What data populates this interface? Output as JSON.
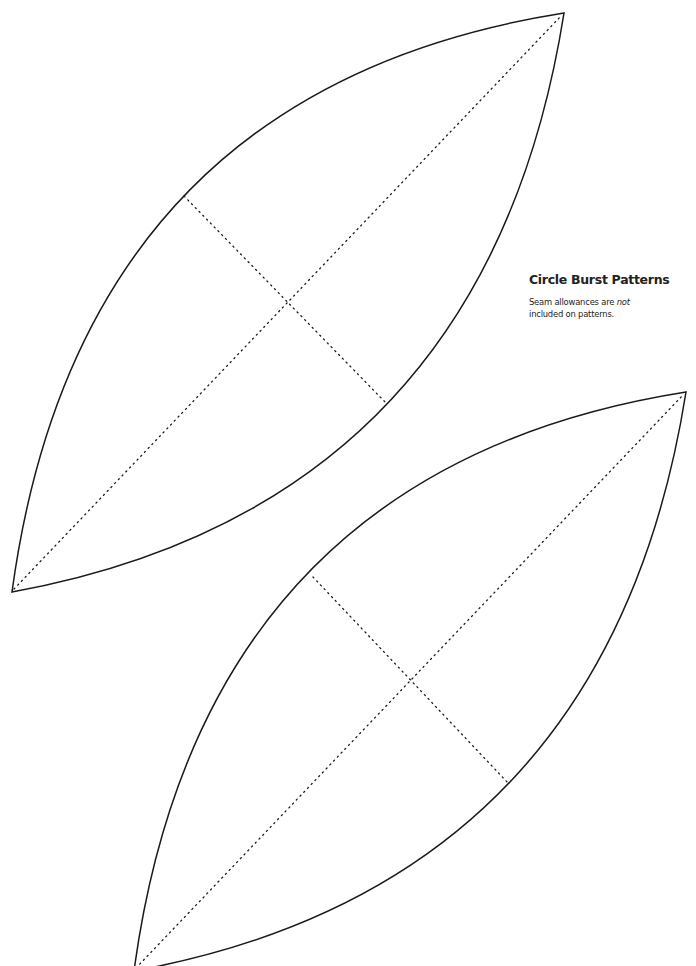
{
  "document": {
    "title": "Circle Burst Patterns",
    "note": {
      "line1_prefix": "Seam allowances are ",
      "line1_emphasis": "not",
      "line2": "included on patterns."
    }
  },
  "colors": {
    "background": "#ffffff",
    "outline": "#1a1a1a",
    "text": "#222222"
  },
  "pattern_pieces": [
    {
      "name": "leaf-piece-1",
      "tip_bottom_left": [
        12,
        592
      ],
      "tip_top_right": [
        564,
        13
      ],
      "cross_line": [
        [
          184,
          196
        ],
        [
          387,
          404
        ]
      ]
    },
    {
      "name": "leaf-piece-2",
      "tip_bottom_left": [
        134,
        971
      ],
      "tip_top_right": [
        686,
        392
      ],
      "cross_line": [
        [
          313,
          577
        ],
        [
          509,
          784
        ]
      ]
    }
  ]
}
